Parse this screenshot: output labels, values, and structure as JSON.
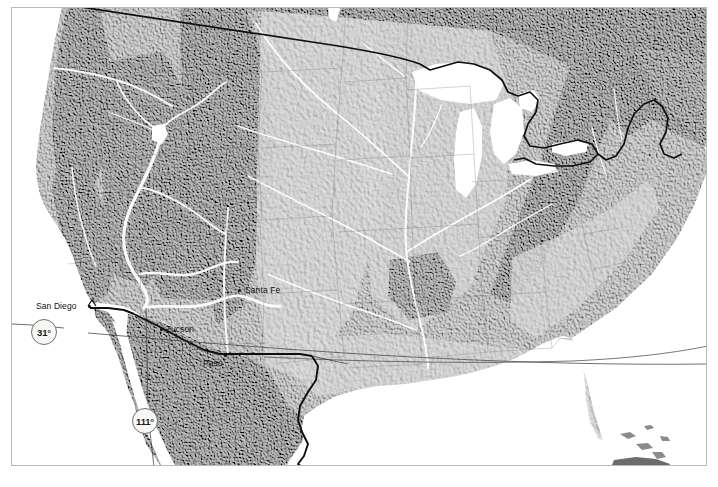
{
  "figure": {
    "type": "physical-relief-map",
    "region": "Continental United States and northern Mexico",
    "style": "grayscale shaded relief",
    "frame": {
      "border_color": "#b9b9b9",
      "background": "#ffffff"
    }
  },
  "map": {
    "width": 718,
    "height": 487,
    "basemap_colors": {
      "land_light": "#bdbdbd",
      "land_mid": "#a5a5a5",
      "land_dark": "#7f7f7f",
      "water": "#ffffff",
      "river": "#ffffff",
      "border_line": "#111111",
      "graticule_line": "#555555"
    },
    "cities": [
      {
        "name": "San Diego",
        "label": "San Diego",
        "label_x": 24,
        "label_y": 297,
        "dot_x": 78,
        "dot_y": 300,
        "label_anchor": "right-of-dot"
      },
      {
        "name": "Tucson",
        "label": "Tucson",
        "label_x": 157,
        "label_y": 320,
        "dot_x": 152,
        "dot_y": 324,
        "label_anchor": "left-of-dot"
      },
      {
        "name": "El Paso",
        "label": "Paso",
        "label_x": 196,
        "label_y": 355,
        "dot_x": 214,
        "dot_y": 352,
        "label_anchor": "left-of-dot"
      },
      {
        "name": "Santa Fe",
        "label": "Santa Fe",
        "label_x": 236,
        "label_y": 282,
        "dot_x": 231,
        "dot_y": 286,
        "label_anchor": "left-of-dot"
      }
    ],
    "graticule_labels": [
      {
        "value": "31°",
        "kind": "latitude",
        "x": 30,
        "y": 318
      },
      {
        "value": "111°",
        "kind": "longitude",
        "x": 131,
        "y": 410
      }
    ],
    "graticule_lines": [
      {
        "kind": "latitude",
        "value": "31°",
        "description": "near-horizontal line crossing the full map at ~31 degrees north"
      },
      {
        "kind": "longitude",
        "value": "111°",
        "description": "near-vertical line descending through Baja California / Sonora"
      }
    ],
    "boundaries": [
      {
        "name": "us-canada-border",
        "description": "49th parallel and Great Lakes / Maine boundary"
      },
      {
        "name": "us-mexico-border",
        "description": "California-Arizona-New Mexico-Texas boundary following the Rio Grande"
      },
      {
        "name": "state-boundaries",
        "description": "faint interior state outlines"
      }
    ],
    "water_features": [
      {
        "name": "Great Lakes"
      },
      {
        "name": "Gulf of Mexico"
      },
      {
        "name": "Pacific Ocean"
      },
      {
        "name": "Atlantic Ocean"
      },
      {
        "name": "Gulf of California"
      },
      {
        "name": "Great Salt Lake"
      },
      {
        "name": "Colorado River"
      },
      {
        "name": "Rio Grande"
      },
      {
        "name": "Mississippi River"
      },
      {
        "name": "Missouri River"
      }
    ]
  }
}
